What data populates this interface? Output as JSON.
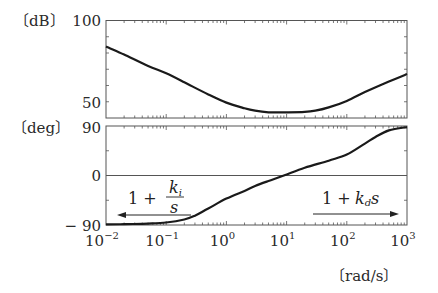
{
  "chart_data": [
    {
      "type": "line",
      "title": "",
      "panel": "magnitude",
      "ylabel": "[dB]",
      "xlabel": "",
      "xscale": "log",
      "xlim": [
        0.01,
        1000
      ],
      "ylim": [
        40,
        100
      ],
      "yticks_labeled": [
        {
          "value": 100,
          "label": "100"
        },
        {
          "value": 50,
          "label": "50"
        }
      ],
      "yticks_minor": [
        90,
        80,
        70,
        60
      ],
      "grid": false,
      "series": [
        {
          "name": "PID magnitude",
          "x": [
            0.01,
            0.02,
            0.05,
            0.1,
            0.2,
            0.5,
            1,
            2,
            3,
            5,
            10,
            20,
            30,
            50,
            100,
            200,
            500,
            1000
          ],
          "values": [
            84,
            79,
            72,
            67.5,
            62,
            54.5,
            49.5,
            46,
            44.5,
            43.5,
            43.5,
            43.8,
            44.5,
            46.5,
            50.5,
            56,
            62.5,
            67
          ]
        }
      ]
    },
    {
      "type": "line",
      "title": "",
      "panel": "phase",
      "ylabel": "[deg]",
      "xlabel": "[rad/s]",
      "xscale": "log",
      "xlim": [
        0.01,
        1000
      ],
      "ylim": [
        -90,
        90
      ],
      "yticks_labeled": [
        {
          "value": 90,
          "label": "90"
        },
        {
          "value": 0,
          "label": "0"
        },
        {
          "value": -90,
          "label": "-90"
        }
      ],
      "xticks_labeled": [
        {
          "value": 0.01,
          "base": "10",
          "exp": "-2"
        },
        {
          "value": 0.1,
          "base": "10",
          "exp": "-1"
        },
        {
          "value": 1,
          "base": "10",
          "exp": "0"
        },
        {
          "value": 10,
          "base": "10",
          "exp": "1"
        },
        {
          "value": 100,
          "base": "10",
          "exp": "2"
        },
        {
          "value": 1000,
          "base": "10",
          "exp": "3"
        }
      ],
      "reference_line": {
        "y": 0
      },
      "grid": false,
      "series": [
        {
          "name": "PID phase",
          "x": [
            0.01,
            0.02,
            0.05,
            0.1,
            0.2,
            0.3,
            0.5,
            1,
            2,
            3,
            5,
            9,
            20,
            50,
            100,
            200,
            300,
            500,
            1000
          ],
          "values": [
            -89,
            -88.5,
            -87.5,
            -85.5,
            -80,
            -73,
            -60,
            -42,
            -28,
            -19,
            -10,
            0,
            14,
            27,
            38,
            58,
            70,
            82,
            88
          ]
        }
      ],
      "annotations": [
        {
          "text_parts": {
            "one": "1",
            "plus": "+",
            "num": "k",
            "num_sub": "i",
            "den": "s"
          },
          "arrow": "left",
          "description": "integral term dominates at low frequency"
        },
        {
          "text_parts": {
            "one": "1",
            "plus": "+",
            "k": "k",
            "k_sub": "d",
            "s": "s"
          },
          "arrow": "right",
          "description": "derivative term dominates at high frequency"
        }
      ]
    }
  ],
  "labels": {
    "db_unit": "〔dB〕",
    "deg_unit": "〔deg〕",
    "x_unit": "〔rad/s〕",
    "mag_100": "100",
    "mag_50": "50",
    "ph_90": "90",
    "ph_0": "0",
    "ph_m90": "− 90",
    "ki_one_plus": "1 +",
    "ki_num": "k",
    "ki_num_sub": "i",
    "ki_den": "s",
    "kd_one_plus": "1 +",
    "kd_k": "k",
    "kd_sub": "d",
    "kd_s": "s",
    "xt": [
      {
        "base": "10",
        "exp": "−2"
      },
      {
        "base": "10",
        "exp": "−1"
      },
      {
        "base": "10",
        "exp": "0"
      },
      {
        "base": "10",
        "exp": "1"
      },
      {
        "base": "10",
        "exp": "2"
      },
      {
        "base": "10",
        "exp": "3"
      }
    ]
  },
  "colors": {
    "curve": "#1a1a1a",
    "axes": "#555555",
    "text": "#2a2a2a"
  }
}
